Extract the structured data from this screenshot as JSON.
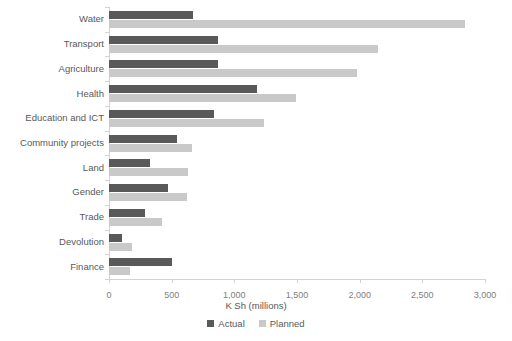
{
  "chart_data": {
    "type": "bar",
    "orientation": "horizontal",
    "title": "",
    "xlabel": "K Sh (millions)",
    "ylabel": "",
    "xlim": [
      0,
      3000
    ],
    "xticks": [
      0,
      500,
      1000,
      1500,
      2000,
      2500,
      3000
    ],
    "xticklabels": [
      "0",
      "500",
      "1,000",
      "1,500",
      "2,000",
      "2,500",
      "3,000"
    ],
    "grid": false,
    "legend_position": "bottom",
    "categories": [
      "Water",
      "Transport",
      "Agriculture",
      "Health",
      "Education and ICT",
      "Community projects",
      "Land",
      "Gender",
      "Trade",
      "Devolution",
      "Finance"
    ],
    "series": [
      {
        "name": "Actual",
        "color": "#595959",
        "values": [
          670,
          870,
          870,
          1180,
          840,
          545,
          330,
          470,
          285,
          105,
          500
        ]
      },
      {
        "name": "Planned",
        "color": "#c9c9c9",
        "values": [
          2840,
          2150,
          1980,
          1490,
          1240,
          660,
          630,
          625,
          420,
          180,
          170
        ]
      }
    ]
  },
  "legend": {
    "items": [
      {
        "label": "Actual",
        "color": "#595959"
      },
      {
        "label": "Planned",
        "color": "#c9c9c9"
      }
    ]
  },
  "axis": {
    "x_title": "K Sh (millions)"
  },
  "colors": {
    "actual": "#595959",
    "planned": "#c9c9c9",
    "axis": "#d3d3d3",
    "text": "#595959",
    "tick_text": "#808080",
    "background": "#ffffff"
  }
}
